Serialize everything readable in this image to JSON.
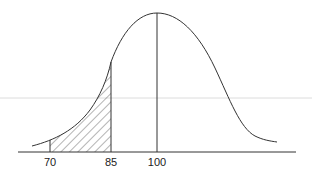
{
  "figure": {
    "type": "normal-distribution-curve",
    "mean_label": "100",
    "tick_labels": [
      {
        "value": "70",
        "x": 50
      },
      {
        "value": "85",
        "x": 111
      },
      {
        "value": "100",
        "x": 157
      }
    ],
    "shaded_region": {
      "from": "70",
      "to": "85",
      "pattern": "diagonal-hatch"
    },
    "colors": {
      "line": "#333333",
      "background": "#ffffff",
      "artifact_line": "#dcdcdc"
    }
  }
}
